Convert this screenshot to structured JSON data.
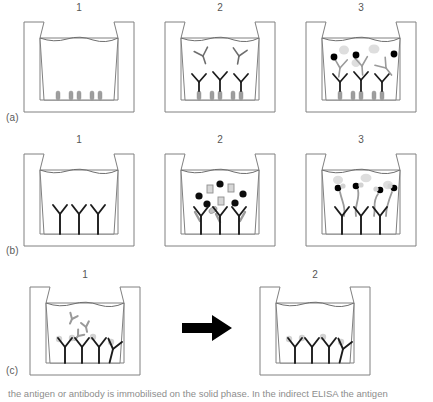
{
  "figure": {
    "rows": [
      {
        "id": "a",
        "label": "(a)",
        "name": "indirect-elisa",
        "panels": [
          {
            "number": "1",
            "name": "antigen-coated-well",
            "description": "Microtitre well coated with antigen, filled with buffer",
            "contents": {
              "liquid": true,
              "surface_antigens": 5,
              "bound_antibodies": 0,
              "free_antibodies": 0,
              "labeled_antibodies": 0,
              "substrate_blobs": 0
            }
          },
          {
            "number": "2",
            "name": "primary-antibody-binding",
            "description": "Primary antibody added; some free in solution, some bound to antigen",
            "contents": {
              "liquid": true,
              "surface_antigens": 5,
              "bound_antibodies": 3,
              "free_antibodies": 2,
              "labeled_antibodies": 0,
              "substrate_blobs": 0
            }
          },
          {
            "number": "3",
            "name": "enzyme-conjugate-and-substrate",
            "description": "Enzyme-labelled secondary antibody bound; coloured product formed",
            "contents": {
              "liquid": true,
              "surface_antigens": 5,
              "bound_antibodies": 3,
              "free_antibodies": 0,
              "labeled_antibodies": 3,
              "substrate_blobs": 3
            }
          }
        ]
      },
      {
        "id": "b",
        "label": "(b)",
        "name": "sandwich-elisa",
        "panels": [
          {
            "number": "1",
            "name": "capture-antibody-coated-well",
            "description": "Well coated with capture antibody",
            "contents": {
              "liquid": true,
              "capture_antibodies": 3,
              "analytes_circle": 0,
              "analytes_square": 0,
              "analytes_ellipse": 0,
              "detection_antibodies": 0,
              "labeled_antibodies": 0,
              "substrate_blobs": 0
            }
          },
          {
            "number": "2",
            "name": "sample-analyte-capture",
            "description": "Sample added; target analyte captured, other molecules remain free",
            "contents": {
              "liquid": true,
              "capture_antibodies": 3,
              "analytes_circle": 5,
              "analytes_square": 3,
              "analytes_ellipse": 1,
              "detection_antibodies": 3,
              "labeled_antibodies": 0,
              "substrate_blobs": 0
            }
          },
          {
            "number": "3",
            "name": "detection-antibody-and-signal",
            "description": "Enzyme-labelled detection antibody bound; coloured product formed",
            "contents": {
              "liquid": true,
              "capture_antibodies": 3,
              "analytes_circle": 0,
              "analytes_square": 0,
              "analytes_ellipse": 0,
              "detection_antibodies": 3,
              "labeled_antibodies": 4,
              "substrate_blobs": 3
            }
          }
        ]
      },
      {
        "id": "c",
        "label": "(c)",
        "name": "competitive-elisa",
        "panels": [
          {
            "number": "1",
            "name": "competition-step",
            "description": "Labelled and unlabelled antigen compete for coated antibody",
            "contents": {
              "liquid": true,
              "capture_antibodies": 4,
              "free_fragments": 3,
              "bound_labels": 4
            }
          },
          {
            "number": "2",
            "name": "post-wash-bound-label",
            "description": "After washing, only bound labelled antigen remains",
            "contents": {
              "liquid": true,
              "capture_antibodies": 4,
              "free_fragments": 0,
              "bound_labels": 4
            }
          }
        ],
        "arrow": {
          "name": "process-arrow",
          "direction": "right",
          "glyph": "→"
        }
      }
    ],
    "caption": "the antigen or antibody is immobilised on the solid phase. In the indirect ELISA the antigen"
  },
  "colors": {
    "outline": "#808080",
    "liquid_line": "#6f6f6f",
    "antibody_dark": "#1c1c1c",
    "antibody_gray": "#9a9a9a",
    "antigen_gray": "#9e9e9e",
    "enzyme_black": "#000000",
    "blob_light": "#d9d9d9",
    "label_gray": "#e0e0e0",
    "text": "#555555",
    "arrow": "#000000",
    "background": "#ffffff"
  }
}
